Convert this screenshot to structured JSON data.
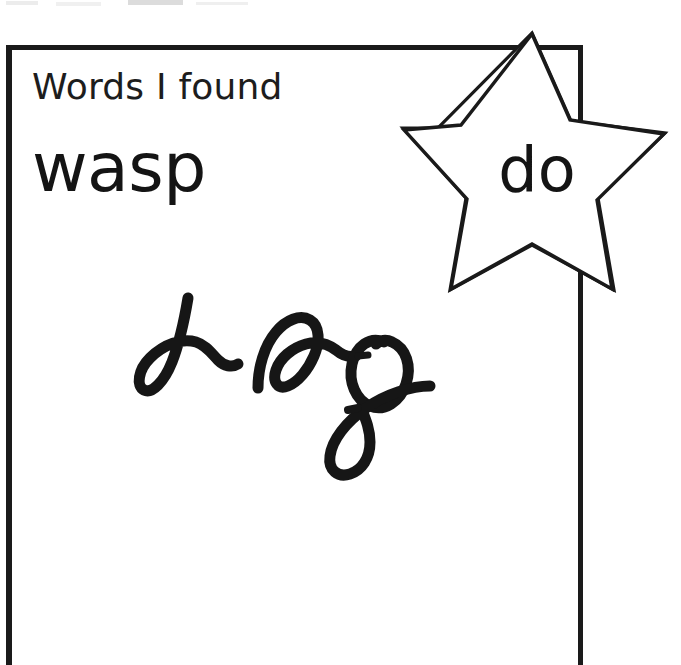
{
  "page": {
    "background_color": "#ffffff",
    "ink_color": "#1a1a1a"
  },
  "worksheet": {
    "heading": "Words I found",
    "printed_words": [
      {
        "text": "wasp",
        "location": "inside-box"
      }
    ],
    "box": {
      "border_color": "#1a1a1a",
      "open_side": "bottom"
    }
  },
  "sticker": {
    "shape": "five-pointed-star",
    "outline_color": "#1a1a1a",
    "fill_color": "#ffffff",
    "word": "do"
  },
  "handwriting": {
    "transcription": "dog",
    "style": "cursive",
    "ink_color": "#1a1a1a"
  },
  "artifacts": {
    "top_edge_smudges": 4,
    "smudge_color": "#e4e4e4"
  }
}
